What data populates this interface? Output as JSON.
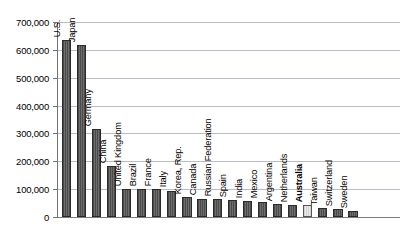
{
  "chart_data": {
    "type": "bar",
    "title": "",
    "xlabel": "",
    "ylabel": "",
    "ylim": [
      0,
      700000
    ],
    "grid": true,
    "legend": "none",
    "orientation": "vertical",
    "tick_labels": [
      "700,000",
      "600,000",
      "500,000",
      "400,000",
      "300,000",
      "200,000",
      "100,000",
      "0"
    ],
    "tick_values": [
      700000,
      600000,
      500000,
      400000,
      300000,
      200000,
      100000,
      0
    ],
    "categories": [
      "U.S.",
      "Japan",
      "Germany",
      "China",
      "United Kingdom",
      "Brazil",
      "France",
      "Italy",
      "Korea, Rep.",
      "Canada",
      "Russian Federation",
      "Spain",
      "India",
      "Mexico",
      "Argentina",
      "Netherlands",
      "Australia",
      "Taiwan",
      "Switzerland",
      "Sweden"
    ],
    "values": [
      635000,
      617000,
      315000,
      183000,
      101000,
      100000,
      99000,
      95000,
      72000,
      66000,
      64000,
      60000,
      56000,
      55000,
      46000,
      42000,
      42000,
      31000,
      27000,
      22000
    ],
    "highlight_category": "Australia",
    "highlight_color": "#dcdcdc",
    "bar_color": "#5a5a5a",
    "bar_edge_color": "#2b2b2b",
    "gridline_color": "#b9bcc4",
    "axis_color": "#6f7278"
  },
  "artifact": {
    "top_clipped_text": ""
  }
}
